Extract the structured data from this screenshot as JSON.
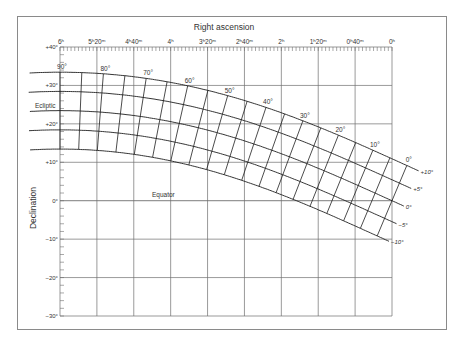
{
  "figure": {
    "title_x": "Right ascension",
    "title_y": "Declination",
    "ecliptic_label": "Ecliptic",
    "equator_label": "Equator"
  },
  "axes": {
    "ra_ticks": [
      {
        "hours": 6,
        "label": "6ʰ"
      },
      {
        "hours": 5.3333,
        "label": "5ʰ20ᵐ"
      },
      {
        "hours": 4.6667,
        "label": "4ʰ40ᵐ"
      },
      {
        "hours": 4,
        "label": "4ʰ"
      },
      {
        "hours": 3.3333,
        "label": "3ʰ20ᵐ"
      },
      {
        "hours": 2.6667,
        "label": "2ʰ40ᵐ"
      },
      {
        "hours": 2,
        "label": "2ʰ"
      },
      {
        "hours": 1.3333,
        "label": "1ʰ20ᵐ"
      },
      {
        "hours": 0.6667,
        "label": "0ʰ40ᵐ"
      },
      {
        "hours": 0,
        "label": "0ʰ"
      }
    ],
    "ra_range_hours": [
      6,
      0
    ],
    "ra_minor_tick_minutes": 4,
    "dec_ticks": [
      {
        "deg": 40,
        "label": "+40°"
      },
      {
        "deg": 30,
        "label": "+30°"
      },
      {
        "deg": 20,
        "label": "+20°"
      },
      {
        "deg": 10,
        "label": "+10°"
      },
      {
        "deg": 0,
        "label": "0°"
      },
      {
        "deg": -10,
        "label": "−10°"
      },
      {
        "deg": -20,
        "label": "−20°"
      },
      {
        "deg": -30,
        "label": "−30°"
      }
    ],
    "dec_range_deg": [
      -30,
      40
    ],
    "dec_minor_tick_deg": 2
  },
  "ecliptic_grid": {
    "obliquity_deg": 23.44,
    "latitudes": [
      {
        "beta": 10,
        "label": "+10°"
      },
      {
        "beta": 5,
        "label": "+5°"
      },
      {
        "beta": 0,
        "label": "0°"
      },
      {
        "beta": -5,
        "label": "−5°"
      },
      {
        "beta": -10,
        "label": "−10°"
      }
    ],
    "longitude_step_deg": 5,
    "longitude_range_deg": [
      0,
      90
    ],
    "longitude_labels": [
      {
        "lambda": 90,
        "label": "90°"
      },
      {
        "lambda": 80,
        "label": "80°"
      },
      {
        "lambda": 70,
        "label": "70°"
      },
      {
        "lambda": 60,
        "label": "60°"
      },
      {
        "lambda": 50,
        "label": "50°"
      },
      {
        "lambda": 40,
        "label": "40°"
      },
      {
        "lambda": 30,
        "label": "30°"
      },
      {
        "lambda": 20,
        "label": "20°"
      },
      {
        "lambda": 10,
        "label": "10°"
      },
      {
        "lambda": 0,
        "label": "0°"
      }
    ]
  },
  "colors": {
    "grid": "#6e6e6e",
    "curve": "#1e1e1e",
    "text": "#333333",
    "frame": "#8a8a8a"
  }
}
